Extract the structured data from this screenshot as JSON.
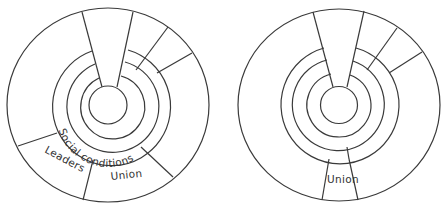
{
  "diagrams": [
    {
      "id": "left",
      "labels": {
        "ring": "Social conditions",
        "segment_left": "Leaders",
        "segment_right": "Union"
      }
    },
    {
      "id": "right",
      "labels": {
        "segment": "Union"
      }
    }
  ],
  "colors": {
    "stroke": "#3a3a3a",
    "text": "#333333",
    "background": "#ffffff"
  }
}
